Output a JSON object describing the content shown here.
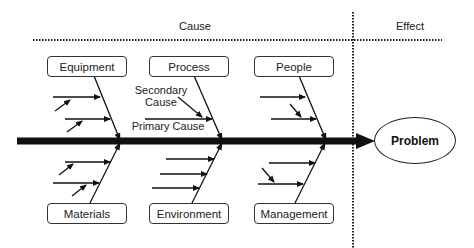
{
  "headers": {
    "cause": "Cause",
    "effect": "Effect"
  },
  "categories_top": [
    {
      "label": "Equipment"
    },
    {
      "label": "Process"
    },
    {
      "label": "People"
    }
  ],
  "categories_bottom": [
    {
      "label": "Materials"
    },
    {
      "label": "Environment"
    },
    {
      "label": "Management"
    }
  ],
  "annotations": {
    "secondary_cause": "Secondary Cause",
    "primary_cause": "Primary Cause"
  },
  "effect": {
    "label": "Problem"
  },
  "colors": {
    "line": "#111111",
    "text": "#222222",
    "background": "#ffffff"
  }
}
